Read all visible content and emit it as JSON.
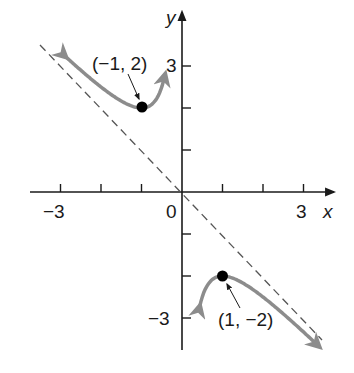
{
  "chart_data": {
    "type": "line",
    "title": "",
    "function": "f(x) = -x - 1/x",
    "xlabel": "x",
    "ylabel": "y",
    "xlim": [
      -3.6,
      3.7
    ],
    "ylim": [
      -4.2,
      4.2
    ],
    "x_ticks": [
      -3,
      -2,
      -1,
      1,
      2,
      3
    ],
    "y_ticks": [
      -3,
      -2,
      -1,
      1,
      2,
      3
    ],
    "x_tick_labels": [
      "-3",
      "0",
      "3"
    ],
    "y_tick_labels": [
      "3",
      "-3"
    ],
    "grid": false,
    "legend": null,
    "series": [
      {
        "name": "branch x<0",
        "style": "solid gray with arrows",
        "x": [
          -3.4,
          -3,
          -2,
          -1.5,
          -1,
          -0.7,
          -0.5,
          -0.38
        ],
        "y": [
          3.69,
          3.33,
          2.5,
          2.17,
          2.0,
          2.13,
          2.5,
          3.01
        ]
      },
      {
        "name": "branch x>0",
        "style": "solid gray with arrows",
        "x": [
          0.38,
          0.5,
          0.7,
          1,
          1.5,
          2,
          3,
          3.4
        ],
        "y": [
          -3.01,
          -2.5,
          -2.13,
          -2.0,
          -2.17,
          -2.5,
          -3.33,
          -3.69
        ]
      },
      {
        "name": "oblique asymptote y = -x",
        "style": "dashed",
        "x": [
          -3.5,
          3.5
        ],
        "y": [
          3.5,
          -3.5
        ]
      }
    ],
    "annotations": [
      {
        "text": "(−1, 2)",
        "point": [
          -1,
          2
        ]
      },
      {
        "text": "(1, −2)",
        "point": [
          1,
          -2
        ]
      }
    ]
  },
  "labels": {
    "x_axis": "x",
    "y_axis": "y",
    "x_neg3": "−3",
    "x_zero": "0",
    "x_pos3": "3",
    "y_pos3": "3",
    "y_neg3": "−3",
    "pt_min": "(−1, 2)",
    "pt_max": "(1, −2)"
  },
  "colors": {
    "curve": "#8c8c8c",
    "axis": "#1a1a1a",
    "asymptote": "#555555",
    "point": "#000000"
  }
}
